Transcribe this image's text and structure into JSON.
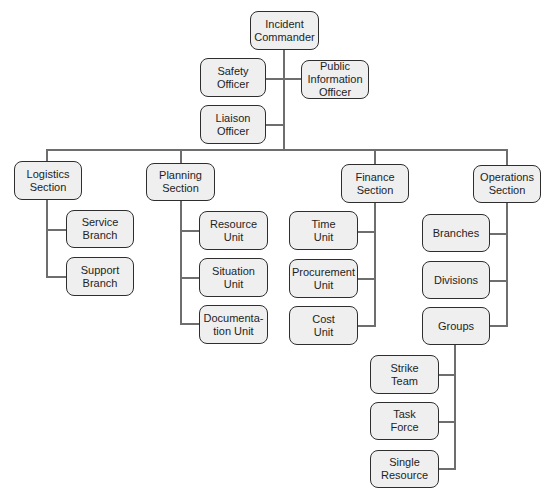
{
  "diagram": {
    "type": "org-chart",
    "title_partial": "",
    "colors": {
      "box_fill": "#efefef",
      "box_border": "#2e2e2e",
      "connector": "#6e6e6e",
      "text": "#1e1e1e"
    },
    "nodes": {
      "incident_commander": "Incident\nCommander",
      "safety_officer": "Safety\nOfficer",
      "public_information_officer": "Public\nInformation\nOfficer",
      "liaison_officer": "Liaison\nOfficer",
      "logistics_section": "Logistics\nSection",
      "planning_section": "Planning\nSection",
      "finance_section": "Finance\nSection",
      "operations_section": "Operations\nSection",
      "service_branch": "Service\nBranch",
      "support_branch": "Support\nBranch",
      "resource_unit": "Resource\nUnit",
      "situation_unit": "Situation\nUnit",
      "documentation_unit": "Documenta-\ntion Unit",
      "time_unit": "Time\nUnit",
      "procurement_unit": "Procurement\nUnit",
      "cost_unit": "Cost\nUnit",
      "branches": "Branches",
      "divisions": "Divisions",
      "groups": "Groups",
      "strike_team": "Strike\nTeam",
      "task_force": "Task\nForce",
      "single_resource": "Single\nResource"
    },
    "edges": [
      [
        "incident_commander",
        "safety_officer"
      ],
      [
        "incident_commander",
        "public_information_officer"
      ],
      [
        "incident_commander",
        "liaison_officer"
      ],
      [
        "incident_commander",
        "logistics_section"
      ],
      [
        "incident_commander",
        "planning_section"
      ],
      [
        "incident_commander",
        "finance_section"
      ],
      [
        "incident_commander",
        "operations_section"
      ],
      [
        "logistics_section",
        "service_branch"
      ],
      [
        "logistics_section",
        "support_branch"
      ],
      [
        "planning_section",
        "resource_unit"
      ],
      [
        "planning_section",
        "situation_unit"
      ],
      [
        "planning_section",
        "documentation_unit"
      ],
      [
        "finance_section",
        "time_unit"
      ],
      [
        "finance_section",
        "procurement_unit"
      ],
      [
        "finance_section",
        "cost_unit"
      ],
      [
        "operations_section",
        "branches"
      ],
      [
        "operations_section",
        "divisions"
      ],
      [
        "operations_section",
        "groups"
      ],
      [
        "groups",
        "strike_team"
      ],
      [
        "groups",
        "task_force"
      ],
      [
        "groups",
        "single_resource"
      ]
    ]
  }
}
